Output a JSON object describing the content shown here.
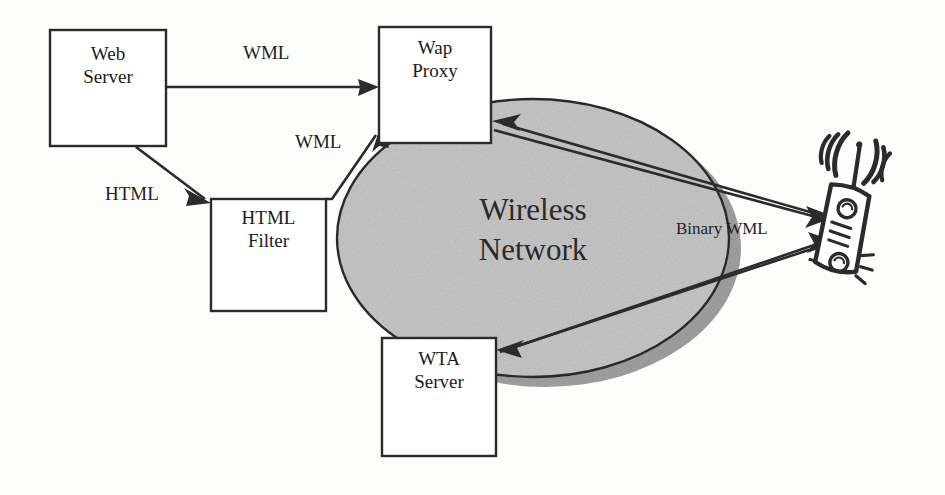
{
  "diagram": {
    "background_color": "#fdfdfc",
    "line_color": "#2b2b2b",
    "cloud_fill": "#c9c9c9",
    "cloud_shadow": "#a0a0a0",
    "nodes": [
      {
        "id": "web-server",
        "label": "Web\nServer",
        "x": 50,
        "y": 30,
        "w": 116,
        "h": 116
      },
      {
        "id": "html-filter",
        "label": "HTML\nFilter",
        "x": 211,
        "y": 199,
        "w": 115,
        "h": 112
      },
      {
        "id": "wap-proxy",
        "label": "Wap\nProxy",
        "x": 379,
        "y": 27,
        "w": 112,
        "h": 116
      },
      {
        "id": "wta-server",
        "label": "WTA\nServer",
        "x": 382,
        "y": 338,
        "w": 114,
        "h": 118
      }
    ],
    "cloud": {
      "id": "wireless-network",
      "label": "Wireless\nNetwork",
      "cx": 533,
      "cy": 238,
      "rx": 196,
      "ry": 139,
      "shadow_dx": 12,
      "shadow_dy": 10
    },
    "device": {
      "id": "mobile-phone",
      "label": "mobile handset with antenna and radio waves"
    },
    "edges": [
      {
        "id": "web-to-proxy",
        "label": "WML",
        "from": "web-server",
        "to": "wap-proxy",
        "label_x": 243,
        "label_y": 42
      },
      {
        "id": "web-to-filter",
        "label": "HTML",
        "from": "web-server",
        "to": "html-filter",
        "label_x": 105,
        "label_y": 183
      },
      {
        "id": "filter-to-proxy",
        "label": "WML",
        "from": "html-filter",
        "to": "wap-proxy",
        "label_x": 295,
        "label_y": 131
      },
      {
        "id": "phone-to-proxy",
        "label": "",
        "from": "mobile-phone",
        "to": "wap-proxy",
        "label_x": 0,
        "label_y": 0
      },
      {
        "id": "proxy-to-phone",
        "label": "Binary WML",
        "from": "wap-proxy",
        "to": "mobile-phone",
        "label_x": 676,
        "label_y": 220
      },
      {
        "id": "phone-to-wta",
        "label": "",
        "from": "mobile-phone",
        "to": "wta-server",
        "label_x": 0,
        "label_y": 0
      },
      {
        "id": "wta-to-phone",
        "label": "",
        "from": "wta-server",
        "to": "mobile-phone",
        "label_x": 0,
        "label_y": 0
      }
    ]
  }
}
